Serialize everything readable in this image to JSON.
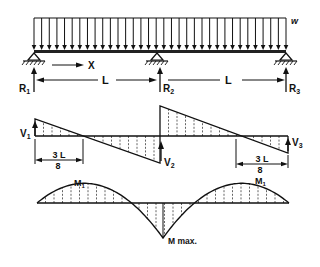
{
  "figure": {
    "load": {
      "label": "w",
      "arrow_count": 34
    },
    "beam": {
      "axis_label": "X",
      "span_labels": [
        "L",
        "L"
      ],
      "reactions": [
        "R1",
        "R2",
        "R3"
      ],
      "reaction_subscripts": [
        "1",
        "2",
        "3"
      ]
    },
    "shear_diagram": {
      "labels": {
        "v1": "V",
        "v1_sub": "1",
        "v2": "V",
        "v2_sub": "2",
        "v3": "V",
        "v3_sub": "3"
      },
      "dimension_left": {
        "numerator": "3 L",
        "denominator": "8"
      },
      "dimension_right": {
        "numerator": "3 L",
        "denominator": "8"
      },
      "relative_values": {
        "V1": 0.375,
        "V2_left": -0.625,
        "V2_right": 0.625,
        "V3": -0.375
      }
    },
    "moment_diagram": {
      "labels": {
        "m1_left": "M",
        "m1_left_sub": "1",
        "m1_right": "M",
        "m1_right_sub": "1",
        "mmax": "M max."
      },
      "relative_values": {
        "M1": 0.0703,
        "Mmax": -0.125
      }
    }
  }
}
